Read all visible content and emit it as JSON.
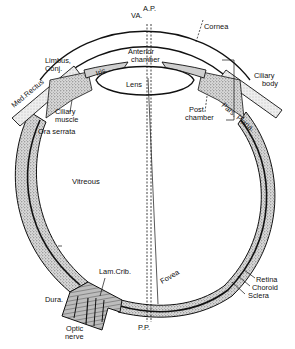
{
  "figure": {
    "colors": {
      "ink": "#111111",
      "stipple": "#9a9a9a",
      "background": "#ffffff"
    }
  },
  "labels": {
    "va": "VA.",
    "ap": "A.P.",
    "cornea": "Cornea",
    "limbus": "Limbus,",
    "conj": "Conj.",
    "iris": "Iris",
    "anterior_1": "Anterior",
    "anterior_2": "chamber",
    "lens": "Lens",
    "med_rectus": "Med.Rectus",
    "ciliary_muscle_1": "Ciliary",
    "ciliary_muscle_2": "muscle",
    "ora_serrata": "Ora serrata",
    "ciliary_body_1": "Ciliary",
    "ciliary_body_2": "body",
    "post_chamber_1": "Post",
    "post_chamber_2": "chamber",
    "pars_plana": "Pars. Plana.",
    "vitreous": "Vitreous",
    "lam_crib": "Lam.Crib.",
    "dura": "Dura.",
    "optic_1": "Optic",
    "optic_2": "nerve",
    "pp": "P.P.",
    "fovea": "Fovea",
    "retina": "Retina",
    "choroid": "Choroid",
    "sclera": "Sclera"
  }
}
